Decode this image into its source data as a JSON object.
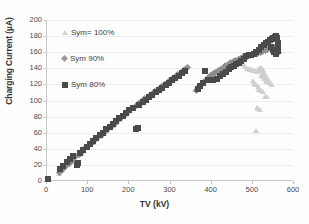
{
  "chart_data": {
    "type": "scatter",
    "title": "",
    "xlabel": "TV (kV)",
    "ylabel": "Charging Current (µA)",
    "xlim": [
      0,
      600
    ],
    "ylim": [
      0,
      200
    ],
    "xticks": [
      0,
      100,
      200,
      300,
      400,
      500,
      600
    ],
    "yticks": [
      0,
      20,
      40,
      60,
      80,
      100,
      120,
      140,
      160,
      180,
      200
    ],
    "grid": "horizontal",
    "legend_position": "inside-upper-left",
    "series": [
      {
        "name": "Sym= 100%",
        "marker": "triangle",
        "color": "#cfcfcf",
        "points": [
          [
            30,
            9
          ],
          [
            36,
            13
          ],
          [
            42,
            17
          ],
          [
            50,
            20
          ],
          [
            58,
            24
          ],
          [
            66,
            27
          ],
          [
            74,
            31
          ],
          [
            82,
            34
          ],
          [
            90,
            38
          ],
          [
            98,
            41
          ],
          [
            106,
            45
          ],
          [
            114,
            48
          ],
          [
            122,
            52
          ],
          [
            130,
            55
          ],
          [
            138,
            59
          ],
          [
            146,
            62
          ],
          [
            154,
            66
          ],
          [
            162,
            69
          ],
          [
            170,
            73
          ],
          [
            178,
            76
          ],
          [
            186,
            80
          ],
          [
            194,
            83
          ],
          [
            202,
            87
          ],
          [
            210,
            90
          ],
          [
            218,
            93
          ],
          [
            226,
            96
          ],
          [
            234,
            99
          ],
          [
            242,
            102
          ],
          [
            250,
            105
          ],
          [
            258,
            108
          ],
          [
            266,
            111
          ],
          [
            274,
            113
          ],
          [
            282,
            116
          ],
          [
            290,
            119
          ],
          [
            298,
            122
          ],
          [
            306,
            125
          ],
          [
            314,
            128
          ],
          [
            322,
            131
          ],
          [
            330,
            134
          ],
          [
            338,
            137
          ],
          [
            360,
            113
          ],
          [
            366,
            116
          ],
          [
            372,
            119
          ],
          [
            378,
            122
          ],
          [
            384,
            125
          ],
          [
            390,
            127
          ],
          [
            396,
            130
          ],
          [
            402,
            132
          ],
          [
            408,
            134
          ],
          [
            414,
            136
          ],
          [
            420,
            138
          ],
          [
            426,
            140
          ],
          [
            432,
            142
          ],
          [
            438,
            143
          ],
          [
            444,
            145
          ],
          [
            450,
            146
          ],
          [
            456,
            147
          ],
          [
            462,
            148
          ],
          [
            468,
            148
          ],
          [
            474,
            146
          ],
          [
            478,
            144
          ],
          [
            482,
            142
          ],
          [
            486,
            140
          ],
          [
            490,
            139
          ],
          [
            494,
            138
          ],
          [
            498,
            138
          ],
          [
            502,
            137
          ],
          [
            506,
            137
          ],
          [
            510,
            136
          ],
          [
            512,
            137
          ],
          [
            514,
            138
          ],
          [
            516,
            139
          ],
          [
            518,
            140
          ],
          [
            520,
            141
          ],
          [
            522,
            140
          ],
          [
            524,
            138
          ],
          [
            526,
            136
          ],
          [
            528,
            134
          ],
          [
            530,
            132
          ],
          [
            532,
            130
          ],
          [
            534,
            128
          ],
          [
            536,
            126
          ],
          [
            538,
            124
          ],
          [
            540,
            124
          ],
          [
            500,
            124
          ],
          [
            504,
            121
          ],
          [
            508,
            119
          ],
          [
            512,
            117
          ],
          [
            516,
            116
          ],
          [
            520,
            131
          ],
          [
            524,
            129
          ],
          [
            528,
            127
          ],
          [
            532,
            125
          ],
          [
            536,
            123
          ],
          [
            540,
            122
          ],
          [
            544,
            121
          ],
          [
            548,
            120
          ],
          [
            516,
            113
          ],
          [
            520,
            112
          ],
          [
            524,
            111
          ],
          [
            530,
            105
          ],
          [
            534,
            104
          ],
          [
            510,
            91
          ],
          [
            514,
            90
          ],
          [
            518,
            89
          ],
          [
            508,
            62
          ]
        ]
      },
      {
        "name": "Sym 90%",
        "marker": "diamond",
        "color": "#8e8e8e",
        "points": [
          [
            30,
            10
          ],
          [
            38,
            14
          ],
          [
            46,
            18
          ],
          [
            54,
            22
          ],
          [
            62,
            26
          ],
          [
            70,
            30
          ],
          [
            78,
            33
          ],
          [
            86,
            37
          ],
          [
            94,
            41
          ],
          [
            102,
            44
          ],
          [
            110,
            48
          ],
          [
            118,
            51
          ],
          [
            126,
            55
          ],
          [
            134,
            58
          ],
          [
            142,
            62
          ],
          [
            150,
            65
          ],
          [
            158,
            69
          ],
          [
            166,
            72
          ],
          [
            174,
            76
          ],
          [
            182,
            79
          ],
          [
            190,
            83
          ],
          [
            198,
            86
          ],
          [
            206,
            90
          ],
          [
            214,
            93
          ],
          [
            222,
            96
          ],
          [
            230,
            99
          ],
          [
            238,
            102
          ],
          [
            246,
            105
          ],
          [
            254,
            108
          ],
          [
            262,
            111
          ],
          [
            270,
            114
          ],
          [
            278,
            117
          ],
          [
            286,
            120
          ],
          [
            294,
            123
          ],
          [
            302,
            126
          ],
          [
            310,
            129
          ],
          [
            318,
            132
          ],
          [
            326,
            135
          ],
          [
            334,
            138
          ],
          [
            342,
            141
          ],
          [
            362,
            112
          ],
          [
            368,
            116
          ],
          [
            374,
            119
          ],
          [
            380,
            122
          ],
          [
            386,
            125
          ],
          [
            392,
            128
          ],
          [
            398,
            131
          ],
          [
            404,
            133
          ],
          [
            410,
            135
          ],
          [
            416,
            137
          ],
          [
            422,
            139
          ],
          [
            428,
            141
          ],
          [
            434,
            143
          ],
          [
            440,
            145
          ],
          [
            446,
            147
          ],
          [
            452,
            148
          ],
          [
            458,
            150
          ],
          [
            464,
            151
          ],
          [
            470,
            152
          ],
          [
            476,
            153
          ],
          [
            482,
            154
          ],
          [
            488,
            155
          ],
          [
            494,
            156
          ],
          [
            500,
            157
          ],
          [
            506,
            158
          ],
          [
            512,
            159
          ],
          [
            518,
            160
          ],
          [
            524,
            161
          ],
          [
            530,
            162
          ],
          [
            536,
            163
          ],
          [
            542,
            164
          ],
          [
            548,
            165
          ],
          [
            552,
            166
          ],
          [
            556,
            167
          ],
          [
            558,
            166
          ],
          [
            560,
            163
          ],
          [
            562,
            160
          ],
          [
            558,
            158
          ]
        ]
      },
      {
        "name": "Sym 80%",
        "marker": "square",
        "color": "#4a4a4a",
        "points": [
          [
            2,
            3
          ],
          [
            32,
            15
          ],
          [
            40,
            19
          ],
          [
            48,
            23
          ],
          [
            56,
            27
          ],
          [
            64,
            31
          ],
          [
            72,
            20
          ],
          [
            76,
            22
          ],
          [
            80,
            35
          ],
          [
            88,
            39
          ],
          [
            96,
            42
          ],
          [
            104,
            46
          ],
          [
            112,
            50
          ],
          [
            120,
            53
          ],
          [
            128,
            57
          ],
          [
            136,
            60
          ],
          [
            144,
            64
          ],
          [
            152,
            67
          ],
          [
            160,
            71
          ],
          [
            168,
            74
          ],
          [
            176,
            78
          ],
          [
            184,
            81
          ],
          [
            192,
            85
          ],
          [
            200,
            88
          ],
          [
            208,
            91
          ],
          [
            216,
            65
          ],
          [
            220,
            66
          ],
          [
            224,
            95
          ],
          [
            232,
            98
          ],
          [
            240,
            101
          ],
          [
            248,
            104
          ],
          [
            256,
            107
          ],
          [
            264,
            110
          ],
          [
            272,
            113
          ],
          [
            280,
            116
          ],
          [
            288,
            119
          ],
          [
            296,
            122
          ],
          [
            304,
            125
          ],
          [
            312,
            128
          ],
          [
            320,
            131
          ],
          [
            328,
            134
          ],
          [
            336,
            137
          ],
          [
            368,
            114
          ],
          [
            372,
            118
          ],
          [
            378,
            122
          ],
          [
            384,
            137
          ],
          [
            390,
            125
          ],
          [
            396,
            126
          ],
          [
            404,
            126
          ],
          [
            412,
            127
          ],
          [
            420,
            130
          ],
          [
            428,
            133
          ],
          [
            436,
            136
          ],
          [
            442,
            139
          ],
          [
            448,
            141
          ],
          [
            454,
            143
          ],
          [
            460,
            145
          ],
          [
            466,
            147
          ],
          [
            472,
            149
          ],
          [
            478,
            152
          ],
          [
            484,
            155
          ],
          [
            490,
            156
          ],
          [
            496,
            157
          ],
          [
            502,
            158
          ],
          [
            508,
            160
          ],
          [
            514,
            163
          ],
          [
            520,
            166
          ],
          [
            526,
            169
          ],
          [
            532,
            171
          ],
          [
            538,
            173
          ],
          [
            542,
            175
          ],
          [
            546,
            177
          ],
          [
            550,
            178
          ],
          [
            554,
            179
          ],
          [
            556,
            180
          ],
          [
            558,
            178
          ],
          [
            560,
            172
          ],
          [
            562,
            166
          ],
          [
            560,
            161
          ],
          [
            556,
            158
          ],
          [
            552,
            160
          ],
          [
            548,
            163
          ],
          [
            544,
            166
          ]
        ]
      }
    ]
  },
  "legend": {
    "entries": [
      {
        "label": "Sym= 100%",
        "marker": "triangle-icon"
      },
      {
        "label": "Sym 90%",
        "marker": "diamond-icon"
      },
      {
        "label": "Sym 80%",
        "marker": "square-icon"
      }
    ]
  }
}
